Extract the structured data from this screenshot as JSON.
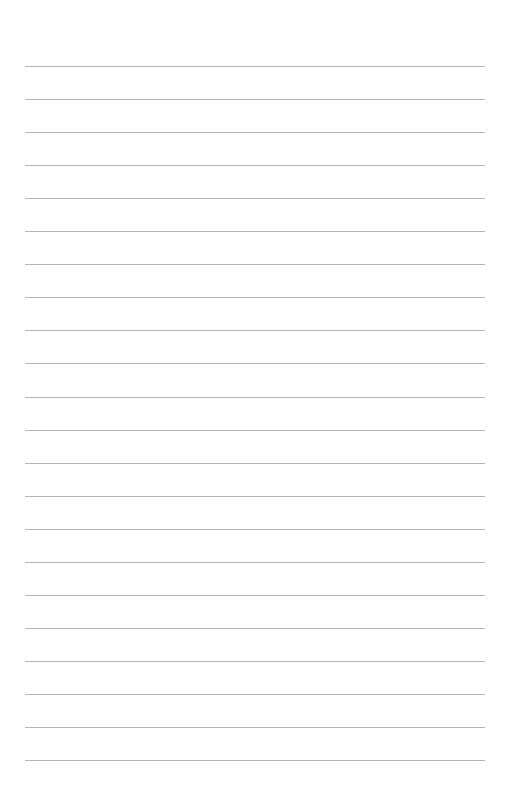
{
  "page": {
    "type": "lined-paper",
    "background_color": "#ffffff",
    "line_color": "#b4b4b4",
    "line_count": 22,
    "first_line_y": 66,
    "line_spacing": 33.05,
    "line_left": 25,
    "line_width": 460
  }
}
